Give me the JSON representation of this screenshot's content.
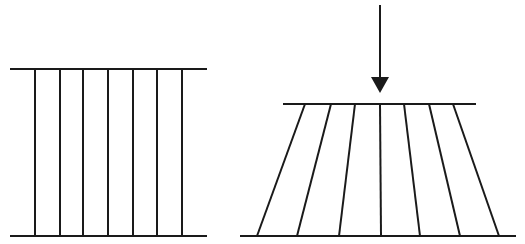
{
  "diagram": {
    "colors": {
      "line": "#1a1a1a",
      "background": "#ffffff"
    },
    "left_panel": {
      "state": "unloaded",
      "top_plate": {
        "x1": 10,
        "x2": 207,
        "y": 69
      },
      "bottom_plate": {
        "x1": 10,
        "x2": 207,
        "y": 236
      },
      "fibers_x": [
        35,
        60,
        83,
        108,
        133,
        157,
        182
      ]
    },
    "right_panel": {
      "state": "loaded",
      "force_arrow": {
        "x": 380,
        "y_start": 5,
        "y_tip": 93,
        "direction": "down"
      },
      "top_plate": {
        "x1": 283,
        "x2": 476,
        "y": 104
      },
      "bottom_plate": {
        "x1": 240,
        "x2": 516,
        "y": 236
      },
      "fibers": [
        {
          "top_x": 305,
          "bottom_x": 257
        },
        {
          "top_x": 331,
          "bottom_x": 297
        },
        {
          "top_x": 355,
          "bottom_x": 339
        },
        {
          "top_x": 380,
          "bottom_x": 381
        },
        {
          "top_x": 404,
          "bottom_x": 420
        },
        {
          "top_x": 429,
          "bottom_x": 460
        },
        {
          "top_x": 453,
          "bottom_x": 499
        }
      ]
    }
  }
}
